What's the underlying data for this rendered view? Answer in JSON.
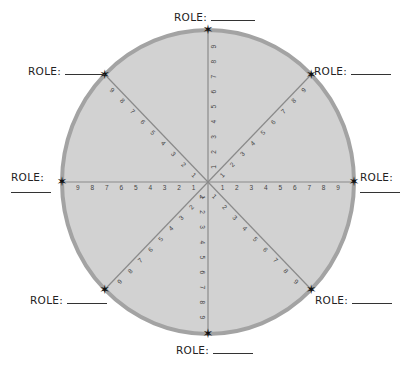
{
  "diagram": {
    "type": "role-wheel",
    "center": [
      208,
      182
    ],
    "radius_x": 146,
    "radius_y": 152,
    "fill_color": "#d2d2d2",
    "border_color": "#a3a3a3",
    "spoke_color": "#8a8a8a",
    "tick_numbers": [
      "1",
      "2",
      "3",
      "4",
      "5",
      "6",
      "7",
      "8",
      "9"
    ],
    "spokes": [
      {
        "name": "top",
        "angle": -90
      },
      {
        "name": "top-right",
        "angle": -45
      },
      {
        "name": "right",
        "angle": 0
      },
      {
        "name": "bottom-right",
        "angle": 45
      },
      {
        "name": "bottom",
        "angle": 90
      },
      {
        "name": "bottom-left",
        "angle": 135
      },
      {
        "name": "left",
        "angle": 180
      },
      {
        "name": "top-left",
        "angle": -135
      }
    ]
  },
  "roles": [
    {
      "position": "top",
      "label": "ROLE:"
    },
    {
      "position": "top-right",
      "label": "ROLE:"
    },
    {
      "position": "right",
      "label": "ROLE:"
    },
    {
      "position": "bottom-right",
      "label": "ROLE:"
    },
    {
      "position": "bottom",
      "label": "ROLE:"
    },
    {
      "position": "bottom-left",
      "label": "ROLE:"
    },
    {
      "position": "left",
      "label": "ROLE:"
    },
    {
      "position": "top-left",
      "label": "ROLE:"
    }
  ]
}
